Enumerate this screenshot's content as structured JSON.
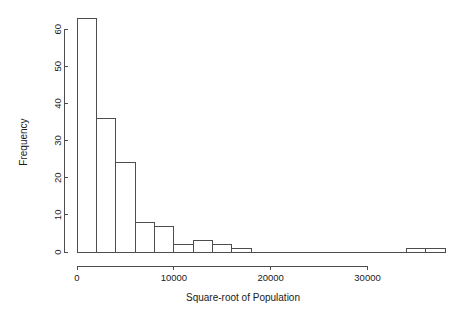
{
  "chart_data": {
    "type": "bar",
    "chart_subtype": "histogram",
    "title": "",
    "xlabel": "Square-root of Population",
    "ylabel": "Frequency",
    "xlim": [
      0,
      38000
    ],
    "ylim": [
      0,
      63
    ],
    "grid": false,
    "legend": null,
    "bin_width": 2000,
    "bin_edges": [
      0,
      2000,
      4000,
      6000,
      8000,
      10000,
      12000,
      14000,
      16000,
      18000,
      20000,
      22000,
      24000,
      26000,
      28000,
      30000,
      32000,
      34000,
      36000,
      38000
    ],
    "categories": [
      "0-2000",
      "2000-4000",
      "4000-6000",
      "6000-8000",
      "8000-10000",
      "10000-12000",
      "12000-14000",
      "14000-16000",
      "16000-18000",
      "18000-20000",
      "20000-22000",
      "22000-24000",
      "24000-26000",
      "26000-28000",
      "28000-30000",
      "30000-32000",
      "32000-34000",
      "34000-36000",
      "36000-38000"
    ],
    "values": [
      63,
      36,
      24,
      8,
      7,
      2,
      3,
      2,
      1,
      0,
      0,
      0,
      0,
      0,
      0,
      0,
      0,
      1,
      1
    ],
    "xticks": [
      0,
      10000,
      20000,
      30000
    ],
    "xtick_labels": [
      "0",
      "10000",
      "20000",
      "30000"
    ],
    "yticks": [
      0,
      10,
      20,
      30,
      40,
      50,
      60
    ],
    "ytick_labels": [
      "0",
      "10",
      "20",
      "30",
      "40",
      "50",
      "60"
    ],
    "colors": {
      "bar_fill": "#ffffff",
      "bar_stroke": "#4d4d4d",
      "axis": "#4d4d4d",
      "text": "#1a1a1a",
      "background": "#ffffff"
    }
  }
}
